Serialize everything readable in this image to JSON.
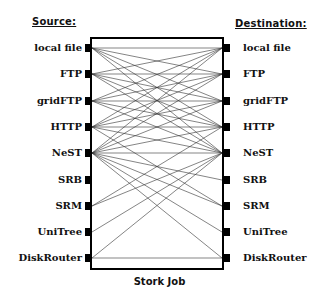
{
  "headers": {
    "source": "Source:",
    "destination": "Destination:"
  },
  "caption": "Stork Job",
  "protocols": [
    "local file",
    "FTP",
    "gridFTP",
    "HTTP",
    "NeST",
    "SRB",
    "SRM",
    "UniTree",
    "DiskRouter"
  ],
  "sources": {
    "0": "local file",
    "1": "FTP",
    "2": "gridFTP",
    "3": "HTTP",
    "4": "NeST",
    "5": "SRB",
    "6": "SRM",
    "7": "UniTree",
    "8": "DiskRouter"
  },
  "destinations": {
    "0": "local file",
    "1": "FTP",
    "2": "gridFTP",
    "3": "HTTP",
    "4": "NeST",
    "5": "SRB",
    "6": "SRM",
    "7": "UniTree",
    "8": "DiskRouter"
  },
  "connections_note": "Full mesh among local file, FTP, gridFTP, HTTP, NeST; NeST bridges to SRB, SRM, UniTree, DiskRouter; DiskRouter to DiskRouter",
  "connections": [
    [
      0,
      0
    ],
    [
      0,
      1
    ],
    [
      0,
      2
    ],
    [
      0,
      3
    ],
    [
      0,
      4
    ],
    [
      1,
      0
    ],
    [
      1,
      1
    ],
    [
      1,
      2
    ],
    [
      1,
      3
    ],
    [
      1,
      4
    ],
    [
      2,
      0
    ],
    [
      2,
      1
    ],
    [
      2,
      2
    ],
    [
      2,
      3
    ],
    [
      2,
      4
    ],
    [
      3,
      0
    ],
    [
      3,
      1
    ],
    [
      3,
      2
    ],
    [
      3,
      3
    ],
    [
      3,
      4
    ],
    [
      3,
      6
    ],
    [
      4,
      0
    ],
    [
      4,
      1
    ],
    [
      4,
      2
    ],
    [
      4,
      3
    ],
    [
      4,
      4
    ],
    [
      4,
      5
    ],
    [
      4,
      6
    ],
    [
      4,
      7
    ],
    [
      4,
      8
    ],
    [
      6,
      3
    ],
    [
      6,
      4
    ],
    [
      7,
      4
    ],
    [
      8,
      4
    ],
    [
      8,
      8
    ]
  ]
}
